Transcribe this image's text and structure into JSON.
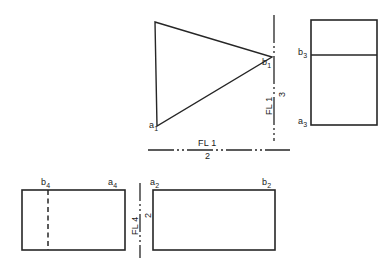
{
  "drawing": {
    "title": "descriptive-geometry-auxiliary-views",
    "stroke_color": "#262626",
    "background_color": "#ffffff",
    "line_width": 1.4
  },
  "views": {
    "view1_triangle": {
      "name": "front-view-triangle",
      "vertices": {
        "apex_top": [
          155,
          22
        ],
        "a1": [
          157,
          126
        ],
        "b1": [
          272,
          57
        ]
      },
      "labels": {
        "a1": "a",
        "a1_sub": "1",
        "b1": "b",
        "b1_sub": "1"
      }
    },
    "view3_right": {
      "name": "auxiliary-view-3-rectangle",
      "rect": [
        311,
        20,
        66,
        105
      ],
      "divider_y": 55,
      "labels": {
        "b3": "b",
        "b3_sub": "3",
        "a3": "a",
        "a3_sub": "3"
      }
    },
    "view4_bottom_left": {
      "name": "auxiliary-view-4-rectangle",
      "rect": [
        22,
        190,
        103,
        60
      ],
      "hidden_line_x": 48,
      "labels": {
        "b4": "b",
        "b4_sub": "4",
        "a4": "a",
        "a4_sub": "4"
      }
    },
    "view2_bottom_right": {
      "name": "top-view-2-rectangle",
      "rect": [
        153,
        190,
        122,
        60
      ],
      "labels": {
        "a2": "a",
        "a2_sub": "2",
        "b2": "b",
        "b2_sub": "2"
      }
    }
  },
  "fold_lines": {
    "horizontal_1_2": {
      "name": "fold-line-1-2",
      "x1": 148,
      "y1": 150,
      "x2": 290,
      "y2": 150,
      "numerator": "FL 1",
      "denominator": "2"
    },
    "vertical_1_3": {
      "name": "fold-line-1-3",
      "x1": 274,
      "y1": 15,
      "x2": 274,
      "y2": 141,
      "numerator": "FL 1",
      "denominator": "3"
    },
    "vertical_4_2": {
      "name": "fold-line-4-2",
      "x1": 140,
      "y1": 183,
      "x2": 140,
      "y2": 258,
      "numerator": "FL 4",
      "denominator": "2"
    }
  }
}
